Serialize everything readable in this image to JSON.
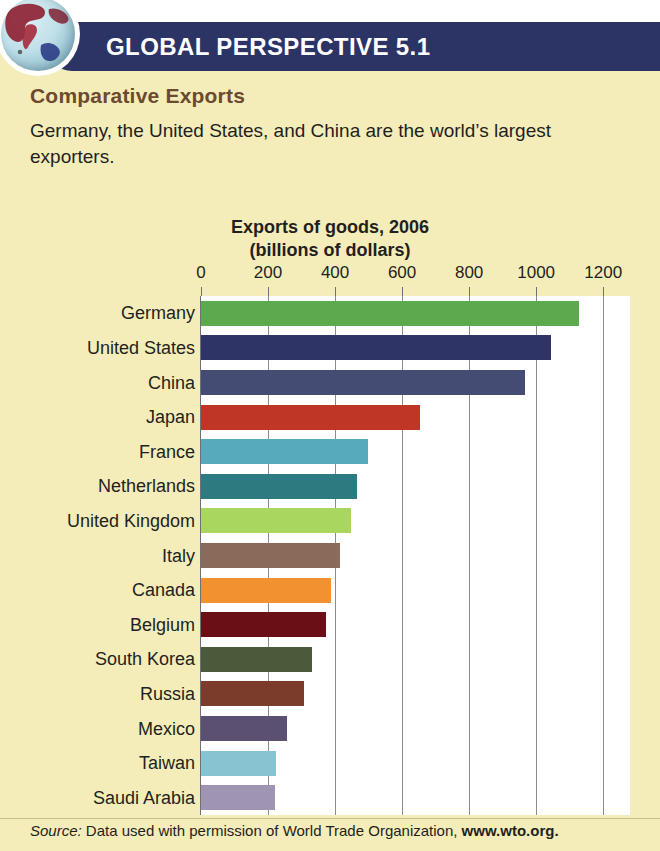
{
  "header": {
    "banner_title": "GLOBAL PERSPECTIVE 5.1",
    "banner_color": "#2c3466",
    "globe_icon": "globe-icon"
  },
  "body": {
    "subtitle": "Comparative Exports",
    "subtitle_color": "#6b4a2f",
    "intro": "Germany, the United States, and China are the world’s largest exporters."
  },
  "source": {
    "prefix": "Source:",
    "text": " Data used with permission of World Trade Organization, ",
    "url": "www.wto.org."
  },
  "chart_data": {
    "type": "bar",
    "orientation": "horizontal",
    "title": "Exports of goods, 2006",
    "subtitle": "(billions of dollars)",
    "xlabel": "",
    "ylabel": "",
    "xlim": [
      0,
      1280
    ],
    "grid": true,
    "legend": "none",
    "ticks": [
      0,
      200,
      400,
      600,
      800,
      1000,
      1200
    ],
    "tick_labels": [
      "0",
      "200",
      "400",
      "600",
      "800",
      "1000",
      "1200"
    ],
    "categories": [
      "Germany",
      "United States",
      "China",
      "Japan",
      "France",
      "Netherlands",
      "United Kingdom",
      "Italy",
      "Canada",
      "Belgium",
      "South Korea",
      "Russia",
      "Mexico",
      "Taiwan",
      "Saudi Arabia"
    ],
    "values": [
      1127,
      1044,
      967,
      654,
      497,
      465,
      448,
      415,
      387,
      372,
      330,
      306,
      258,
      225,
      220
    ],
    "colors": [
      "#5bab4e",
      "#2e3566",
      "#454c74",
      "#bf3526",
      "#56aabc",
      "#2e7a81",
      "#a8d65e",
      "#8a6a5a",
      "#f2912f",
      "#6b0f16",
      "#4c5a3c",
      "#7b3c2b",
      "#5b4f72",
      "#86c4d2",
      "#9f95b2"
    ]
  }
}
